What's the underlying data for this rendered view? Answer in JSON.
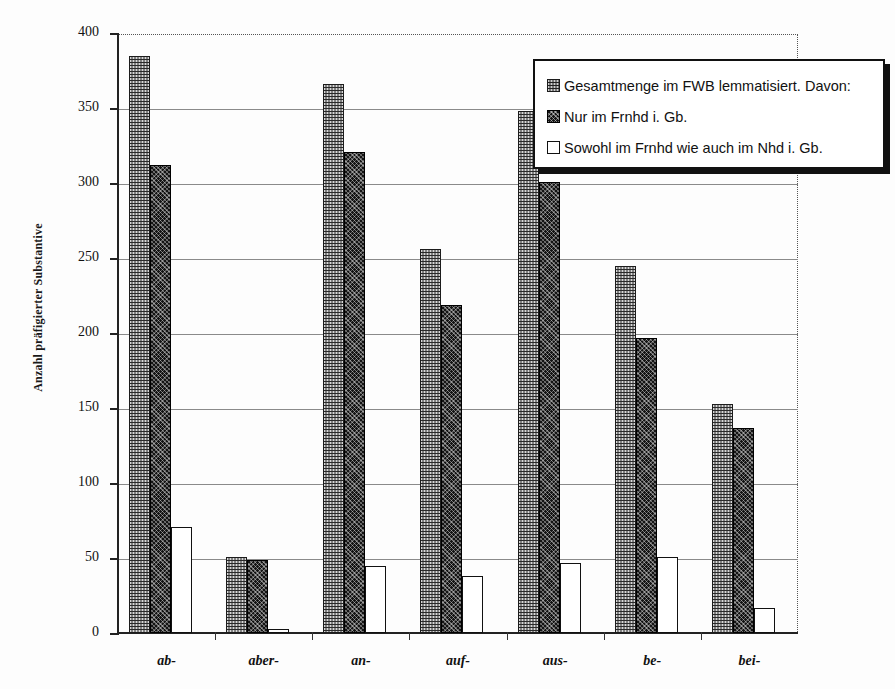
{
  "chart_data": {
    "type": "bar",
    "title": "",
    "xlabel": "",
    "ylabel": "Anzahl präfigierter Substantive",
    "ylim": [
      0,
      400
    ],
    "yticks": [
      0,
      50,
      100,
      150,
      200,
      250,
      300,
      350,
      400
    ],
    "grid": true,
    "legend_position": "top-right",
    "categories": [
      "ab-",
      "aber-",
      "an-",
      "auf-",
      "aus-",
      "be-",
      "bei-"
    ],
    "series": [
      {
        "name": "Gesamtmenge im FWB lemmatisiert. Davon:",
        "pattern": "light-checker",
        "values": [
          385,
          51,
          366,
          256,
          348,
          245,
          153
        ]
      },
      {
        "name": "Nur im Frnhd i. Gb.",
        "pattern": "dark-crosshatch",
        "values": [
          312,
          49,
          321,
          219,
          301,
          197,
          137
        ]
      },
      {
        "name": "Sowohl im Frnhd wie auch im Nhd i. Gb.",
        "pattern": "white-outline",
        "values": [
          71,
          3,
          45,
          38,
          47,
          51,
          17
        ]
      }
    ]
  },
  "axis": {
    "y_title": "Anzahl präfigierter Substantive",
    "y_tick_labels": [
      "400",
      "350",
      "300",
      "250",
      "200",
      "150",
      "100",
      "50",
      "0"
    ],
    "x_tick_labels": [
      "ab-",
      "aber-",
      "an-",
      "auf-",
      "aus-",
      "be-",
      "bei-"
    ]
  },
  "legend": {
    "entries": [
      {
        "label": "Gesamtmenge im FWB lemmatisiert. Davon:",
        "swatch": "light-checker-swatch"
      },
      {
        "label": "Nur im Frnhd i. Gb.",
        "swatch": "dark-crosshatch-swatch"
      },
      {
        "label": "Sowohl im Frnhd wie auch im Nhd i. Gb.",
        "swatch": "white-outline-swatch"
      }
    ]
  },
  "colors": {
    "series_light": "#d8d8d8",
    "series_dark": "#141414",
    "series_white": "#ffffff",
    "axis": "#222222",
    "grid": "#8a8a8a",
    "background": "#fdfdfd"
  }
}
